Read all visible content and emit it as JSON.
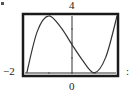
{
  "chart_data": {
    "type": "line",
    "title": "",
    "xlabel": "",
    "ylabel": "",
    "labels": {
      "top": "4",
      "left": "−2",
      "bottom": "0",
      "right": ":"
    },
    "label_note": "Labels transcribed as shown; the mapping of '−2' and '4' to axis ranges is ambiguous in the image, so no numeric coordinate system is inferred.",
    "grid": false,
    "legend": null,
    "frame_px": {
      "left": 23,
      "top": 14,
      "right": 118,
      "bottom": 76
    },
    "yaxis_px_x": 72,
    "baseline_px_y": 73,
    "shape": "cubic-like: rises from bottom-left to a local maximum, decreases through the vertical axis to a local minimum touching the bottom baseline, then rises to the top-right",
    "series": [
      {
        "name": "curve",
        "points_normalized": [
          {
            "x": 0.04,
            "y": 0.05
          },
          {
            "x": 0.15,
            "y": 0.72
          },
          {
            "x": 0.27,
            "y": 0.97
          },
          {
            "x": 0.4,
            "y": 0.78
          },
          {
            "x": 0.51,
            "y": 0.52
          },
          {
            "x": 0.62,
            "y": 0.27
          },
          {
            "x": 0.75,
            "y": 0.05
          },
          {
            "x": 0.87,
            "y": 0.3
          },
          {
            "x": 0.99,
            "y": 0.97
          }
        ],
        "points_note": "Normalized to the plot frame (0 = left/bottom edge, 1 = right/top edge); shape only, estimated from pixels."
      }
    ]
  },
  "colors": {
    "frame": "#1a1a1a",
    "curve": "#333333",
    "axis": "#333333"
  }
}
